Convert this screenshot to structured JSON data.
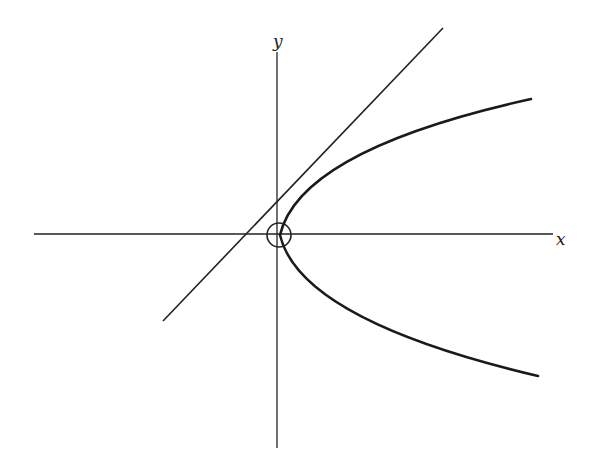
{
  "diagram": {
    "type": "coordinate-plot",
    "colors": {
      "background": "#ffffff",
      "stroke": "#222222"
    },
    "axes": {
      "x_label": "x",
      "y_label": "y",
      "origin_px": [
        277,
        234
      ],
      "x_axis": {
        "x1": 34,
        "y1": 234,
        "x2": 553,
        "y2": 234
      },
      "y_axis": {
        "x1": 277,
        "y1": 52,
        "x2": 277,
        "y2": 448
      }
    },
    "elements": [
      {
        "kind": "line",
        "name": "straight-line",
        "x1": 163,
        "y1": 321,
        "x2": 443,
        "y2": 28
      },
      {
        "kind": "curve",
        "name": "parabola",
        "vertex_px": [
          280,
          235
        ],
        "upper_end_px": [
          531,
          99
        ],
        "lower_end_px": [
          538,
          376
        ],
        "opens": "right"
      },
      {
        "kind": "circle",
        "name": "origin-circle",
        "cx": 279,
        "cy": 235,
        "r": 12
      }
    ]
  }
}
